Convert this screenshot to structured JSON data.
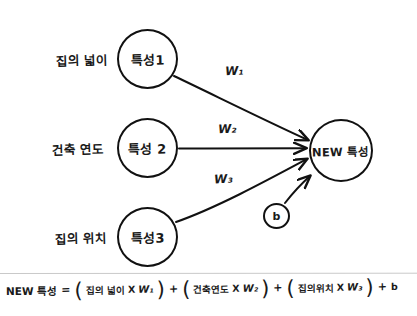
{
  "diagram": {
    "title_note": "handwritten feature-combination diagram",
    "features": [
      {
        "name": "집의 넓이",
        "node": "특성1",
        "weight": "W₁"
      },
      {
        "name": "건축 연도",
        "node": "특성 2",
        "weight": "W₂"
      },
      {
        "name": "집의 위치",
        "node": "특성3",
        "weight": "W₃"
      }
    ],
    "bias": {
      "node": "b"
    },
    "output": {
      "node": "NEW 특성"
    },
    "colors": {
      "ink": "#111111",
      "background": "#ffffff"
    }
  },
  "equation": {
    "lhs": "NEW 특성",
    "equals": "=",
    "open_paren": "(",
    "close_paren": ")",
    "plus": "+",
    "times": "X",
    "terms": [
      {
        "factor": "집의 넓이",
        "weight": "W₁"
      },
      {
        "factor": "건축연도",
        "weight": "W₂"
      },
      {
        "factor": "집의위치",
        "weight": "W₃"
      }
    ],
    "bias_term": "b"
  }
}
